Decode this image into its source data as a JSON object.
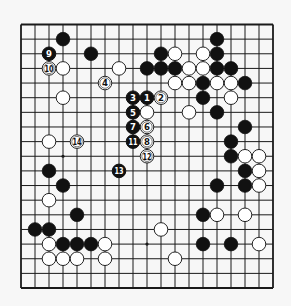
{
  "board": {
    "size": 19,
    "origin_x": 21,
    "origin_y": 24.5,
    "step_x": 14,
    "step_y": 14.64,
    "stone_radius": 6.8,
    "colors": {
      "background": "#f7f7f7",
      "line": "#1a1a1a",
      "black_stone": "#111111",
      "white_stone": "#ffffff",
      "white_stone_border": "#222222"
    },
    "star_points": [
      [
        3,
        3
      ],
      [
        9,
        3
      ],
      [
        15,
        3
      ],
      [
        3,
        9
      ],
      [
        9,
        9
      ],
      [
        15,
        9
      ],
      [
        3,
        15
      ],
      [
        9,
        15
      ],
      [
        15,
        15
      ]
    ]
  },
  "stones": {
    "black": [
      [
        3,
        1
      ],
      [
        5,
        2
      ],
      [
        9,
        3
      ],
      [
        14,
        1
      ],
      [
        10,
        2
      ],
      [
        14,
        2
      ],
      [
        10,
        3
      ],
      [
        11,
        3
      ],
      [
        14,
        3
      ],
      [
        15,
        3
      ],
      [
        13,
        4
      ],
      [
        16,
        4
      ],
      [
        13,
        5
      ],
      [
        14,
        6
      ],
      [
        16,
        7
      ],
      [
        15,
        8
      ],
      [
        15,
        9
      ],
      [
        16,
        10
      ],
      [
        14,
        11
      ],
      [
        16,
        11
      ],
      [
        13,
        13
      ],
      [
        13,
        15
      ],
      [
        15,
        15
      ],
      [
        2,
        10
      ],
      [
        3,
        11
      ],
      [
        4,
        13
      ],
      [
        1,
        14
      ],
      [
        2,
        14
      ],
      [
        3,
        15
      ],
      [
        4,
        15
      ],
      [
        5,
        15
      ]
    ],
    "white": [
      [
        3,
        3
      ],
      [
        7,
        3
      ],
      [
        3,
        5
      ],
      [
        11,
        2
      ],
      [
        13,
        2
      ],
      [
        12,
        3
      ],
      [
        13,
        3
      ],
      [
        11,
        4
      ],
      [
        12,
        4
      ],
      [
        14,
        4
      ],
      [
        15,
        4
      ],
      [
        15,
        5
      ],
      [
        9,
        6
      ],
      [
        12,
        6
      ],
      [
        16,
        9
      ],
      [
        17,
        9
      ],
      [
        17,
        10
      ],
      [
        17,
        11
      ],
      [
        14,
        13
      ],
      [
        16,
        13
      ],
      [
        10,
        14
      ],
      [
        17,
        15
      ],
      [
        11,
        16
      ],
      [
        2,
        8
      ],
      [
        2,
        12
      ],
      [
        2,
        15
      ],
      [
        6,
        15
      ],
      [
        2,
        16
      ],
      [
        3,
        16
      ],
      [
        4,
        16
      ],
      [
        6,
        16
      ]
    ]
  },
  "moves": [
    {
      "n": "1",
      "color": "black",
      "col": 9,
      "row": 5
    },
    {
      "n": "2",
      "color": "white",
      "col": 10,
      "row": 5
    },
    {
      "n": "3",
      "color": "black",
      "col": 8,
      "row": 5
    },
    {
      "n": "4",
      "color": "white",
      "col": 6,
      "row": 4
    },
    {
      "n": "5",
      "color": "black",
      "col": 8,
      "row": 6
    },
    {
      "n": "6",
      "color": "white",
      "col": 9,
      "row": 7
    },
    {
      "n": "7",
      "color": "black",
      "col": 8,
      "row": 7
    },
    {
      "n": "8",
      "color": "white",
      "col": 9,
      "row": 8
    },
    {
      "n": "9",
      "color": "black",
      "col": 2,
      "row": 2
    },
    {
      "n": "10",
      "color": "white",
      "col": 2,
      "row": 3
    },
    {
      "n": "11",
      "color": "black",
      "col": 8,
      "row": 8
    },
    {
      "n": "12",
      "color": "white",
      "col": 9,
      "row": 9
    },
    {
      "n": "13",
      "color": "black",
      "col": 7,
      "row": 10
    },
    {
      "n": "14",
      "color": "white",
      "col": 4,
      "row": 8
    }
  ]
}
